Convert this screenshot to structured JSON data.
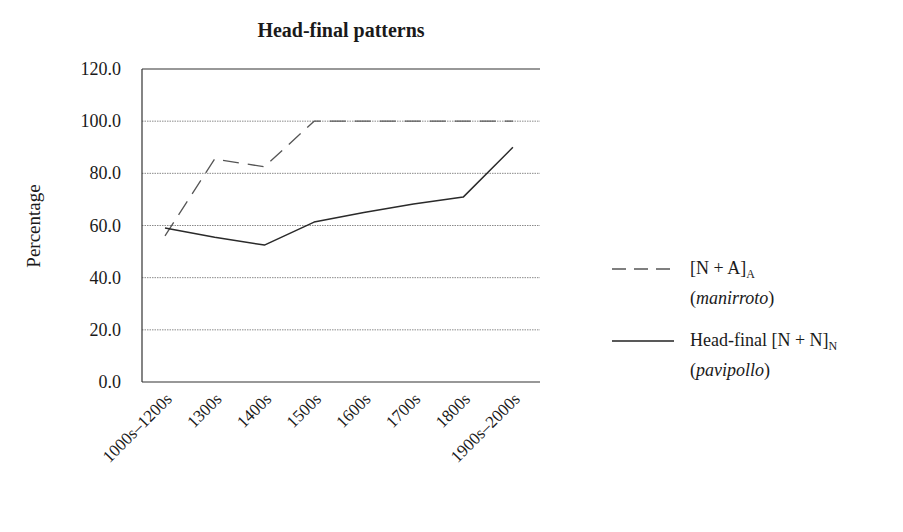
{
  "chart_data": {
    "type": "line",
    "title": "Head-final patterns",
    "xlabel": "",
    "ylabel": "Percentage",
    "ylim": [
      0,
      120
    ],
    "yticks": [
      "0.0",
      "20.0",
      "40.0",
      "60.0",
      "80.0",
      "100.0",
      "120.0"
    ],
    "grid": true,
    "legend_position": "right",
    "categories": [
      "1000s–1200s",
      "1300s",
      "1400s",
      "1500s",
      "1600s",
      "1700s",
      "1800s",
      "1900s–2000s"
    ],
    "series": [
      {
        "name": "[N + A]A (manirroto)",
        "label_main": "[N + A]",
        "label_sub": "A",
        "label_gloss": "manirroto",
        "style": "dashed",
        "values": [
          56.0,
          85.5,
          82.5,
          100.0,
          100.0,
          100.0,
          100.0,
          100.0
        ]
      },
      {
        "name": "Head-final [N + N]N (pavipollo)",
        "label_main": "Head-final [N + N]",
        "label_sub": "N",
        "label_gloss": "pavipollo",
        "style": "solid",
        "values": [
          59.0,
          55.5,
          52.5,
          61.3,
          65.0,
          68.2,
          70.9,
          90.0
        ]
      }
    ]
  },
  "colors": {
    "line": "#2a2a2a",
    "grid": "#8a8a8a",
    "axis": "#333333",
    "text": "#1a1a1a"
  }
}
